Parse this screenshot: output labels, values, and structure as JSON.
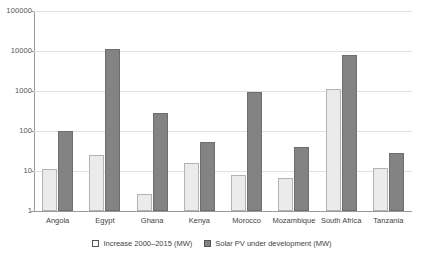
{
  "chart_data": {
    "type": "bar",
    "title": "",
    "subtitle": "",
    "xlabel": "",
    "ylabel": "",
    "yscale": "log",
    "ylim": [
      1,
      100000
    ],
    "ytick_labels": [
      "100000",
      "10000",
      "1000",
      "100",
      "10",
      "1"
    ],
    "ytick_values": [
      100000,
      10000,
      1000,
      100,
      10,
      1
    ],
    "grid": true,
    "legend_position": "bottom-center",
    "categories": [
      "Angola",
      "Egypt",
      "Ghana",
      "Kenya",
      "Morocco",
      "Mozambique",
      "South Africa",
      "Tanzania"
    ],
    "series": [
      {
        "name": "Increase 2000–2015 (MW)",
        "color": "#ebebeb",
        "values": [
          11.5,
          24.5,
          2.7,
          15.5,
          7.8,
          6.7,
          1100,
          12
        ]
      },
      {
        "name": "Solar PV under development (MW)",
        "color": "#838383",
        "values": [
          100,
          11500,
          290,
          52,
          960,
          39,
          8000,
          27.5
        ]
      }
    ]
  },
  "axis": {
    "ticks": [
      {
        "label": "100000",
        "value": 100000
      },
      {
        "label": "10000",
        "value": 10000
      },
      {
        "label": "1000",
        "value": 1000
      },
      {
        "label": "100",
        "value": 100
      },
      {
        "label": "10",
        "value": 10
      },
      {
        "label": "1",
        "value": 1
      }
    ]
  },
  "legend": {
    "items": [
      {
        "label": "Increase 2000–2015 (MW)",
        "swatch": "light"
      },
      {
        "label": "Solar PV under development (MW)",
        "swatch": "dark"
      }
    ]
  }
}
